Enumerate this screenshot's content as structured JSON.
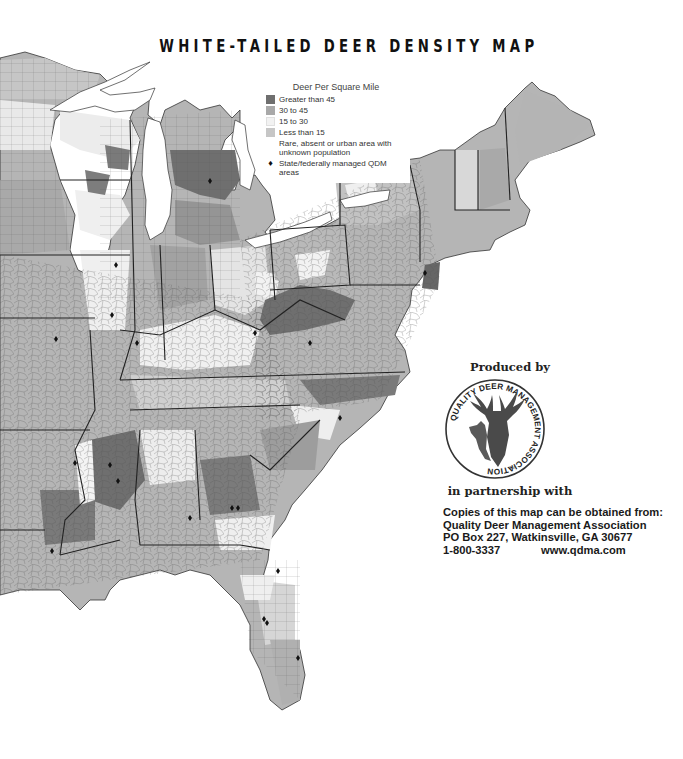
{
  "title": "WHITE-TAILED DEER DENSITY MAP",
  "legend": {
    "title": "Deer Per Square Mile",
    "items": [
      {
        "label": "Greater than 45",
        "color": "#6f6f6f",
        "icon": "swatch"
      },
      {
        "label": "30 to 45",
        "color": "#a9a9a9",
        "icon": "swatch"
      },
      {
        "label": "15 to 30",
        "color": "#f2f2f2",
        "icon": "swatch"
      },
      {
        "label": "Less than 15",
        "color": "#c6c6c6",
        "icon": "swatch"
      },
      {
        "label": "Rare, absent or urban area with unknown population",
        "color": "#ffffff",
        "icon": "swatch"
      },
      {
        "label": "State/federally managed QDM areas",
        "color": "#111111",
        "icon": "diamond-icon"
      }
    ]
  },
  "producer": {
    "produced_by": "Produced by",
    "logo_text": "QUALITY DEER MANAGEMENT ASSOCIATION",
    "logo_tm": "TM",
    "partnership": "in partnership with"
  },
  "contact": {
    "line1": "Copies of this map can be obtained from:",
    "line2": "Quality Deer Management Association",
    "line3": "PO Box 227, Watkinsville, GA 30677",
    "phone": "1-800-3337",
    "website": "www.qdma.com"
  },
  "map": {
    "region": "Eastern United States",
    "colors": {
      "high": "#6f6f6f",
      "medium": "#a9a9a9",
      "low_medium": "#f2f2f2",
      "low": "#c6c6c6",
      "water": "#ffffff",
      "border": "#333333"
    }
  }
}
